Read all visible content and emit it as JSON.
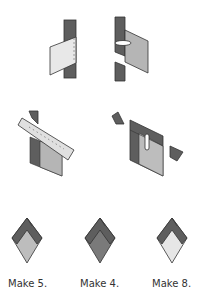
{
  "diagram": {
    "steps": [
      {
        "id": "step-1",
        "description": "light rectangle placed right side down onto dark strip, seam at right edge"
      },
      {
        "id": "step-2",
        "description": "medium rectangle sewn to cut dark strip, pressed open"
      },
      {
        "id": "step-3",
        "description": "ruler aligned diagonally to trim the corner"
      },
      {
        "id": "step-4",
        "description": "trimmed unit with dark corner triangles removed, pressed"
      }
    ],
    "units": [
      {
        "caption": "Make 5.",
        "center_color": "#bdbdbd"
      },
      {
        "caption": "Make 4.",
        "center_color": "#7a7a7a"
      },
      {
        "caption": "Make 8.",
        "center_color": "#e6e6e6"
      }
    ],
    "colors": {
      "dark": "#5e5e5e",
      "medium": "#b5b5b5",
      "light": "#e8e8e8",
      "outline": "#333333"
    }
  }
}
